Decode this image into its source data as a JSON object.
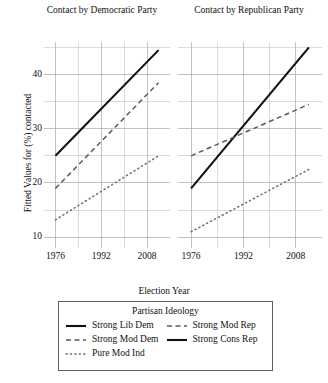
{
  "chart_data": {
    "type": "line",
    "title": "",
    "xlabel": "Election Year",
    "ylabel": "Fitted Values for (%) contacted",
    "xlim": [
      1972,
      2016
    ],
    "ylim": [
      8,
      46
    ],
    "xticks": [
      1976,
      1992,
      2008
    ],
    "yticks": [
      10,
      20,
      30,
      40
    ],
    "grid": true,
    "legend_position": "bottom",
    "legend_title": "Partisan Ideology",
    "panels": [
      {
        "title": "Contact by Democratic Party",
        "x": [
          1976,
          2012
        ],
        "series": [
          {
            "name": "Strong Lib Dem",
            "style": "solid",
            "values": [
              25.0,
              44.5
            ]
          },
          {
            "name": "Strong Mod Dem",
            "style": "dashed",
            "values": [
              19.0,
              38.5
            ]
          },
          {
            "name": "Pure Mod Ind",
            "style": "dotted",
            "values": [
              13.2,
              25.0
            ]
          }
        ]
      },
      {
        "title": "Contact by Republican Party",
        "x": [
          1976,
          2012
        ],
        "series": [
          {
            "name": "Strong Cons Rep",
            "style": "solid",
            "values": [
              19.0,
              45.0
            ]
          },
          {
            "name": "Strong Mod Rep",
            "style": "dashed",
            "values": [
              25.0,
              34.5
            ]
          },
          {
            "name": "Pure Mod Ind",
            "style": "dotted",
            "values": [
              11.0,
              22.5
            ]
          }
        ]
      }
    ],
    "legend_entries": [
      {
        "label": "Strong Lib Dem",
        "style": "solid"
      },
      {
        "label": "Strong Mod Rep",
        "style": "dashed"
      },
      {
        "label": "Strong Mod Dem",
        "style": "dashed"
      },
      {
        "label": "Strong Cons Rep",
        "style": "solid"
      },
      {
        "label": "Pure Mod Ind",
        "style": "dotted"
      }
    ],
    "colors": {
      "solid": "#111111",
      "dashed": "#5a5a5a",
      "dotted": "#6e6e6e",
      "grid": "#a8a8a8",
      "background": "#ffffff"
    }
  }
}
